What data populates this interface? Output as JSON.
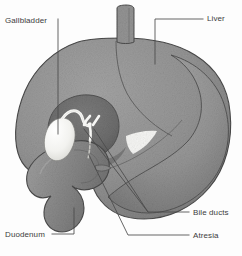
{
  "figure": {
    "background_color": "#fdfdfd"
  },
  "palette": {
    "organ_fill": "#949494",
    "organ_fill_dark": "#6d6d6d",
    "organ_fill_mid": "#878787",
    "organ_shadow": "#5f5f5f",
    "organ_highlight": "#b4b4b4",
    "duct_white": "#f7f7f5",
    "outline": "#4a4a4a",
    "leader_line": "#4a4a4a",
    "label_text": "#3c3c3c"
  },
  "labels": [
    {
      "id": "gallbladder",
      "text": "Gallbladder",
      "position": "top-left",
      "leader": "vertical line descending to gallbladder body"
    },
    {
      "id": "liver",
      "text": "Liver",
      "position": "top-right",
      "leader": "horizontal line then vertical drop into liver lobe"
    },
    {
      "id": "bile-ducts",
      "text": "Bile ducts",
      "position": "bottom-right",
      "leader": "two lines to hepatic duct branches"
    },
    {
      "id": "atresia",
      "text": "Atresia",
      "position": "bottom-right",
      "leader": "line to obliterated duct segment"
    },
    {
      "id": "duodenum",
      "text": "Duodenum",
      "position": "bottom-left",
      "leader": "horizontal line then vertical rise to duodenal loop"
    }
  ],
  "structures": [
    {
      "id": "liver",
      "name": "Liver",
      "shading": "stippled mid-gray"
    },
    {
      "id": "vessel",
      "name": "Vertical vessel / esophagus stub",
      "shading": "mid-gray tube"
    },
    {
      "id": "porta-hepatis",
      "name": "Porta hepatis recess",
      "shading": "dark gray"
    },
    {
      "id": "gallbladder",
      "name": "Gallbladder",
      "shading": "white / pale"
    },
    {
      "id": "cystic-duct",
      "name": "Cystic duct",
      "shading": "white tube"
    },
    {
      "id": "hepatic-duct-y",
      "name": "Hepatic duct bifurcation",
      "shading": "white Y-shape"
    },
    {
      "id": "duodenum",
      "name": "Duodenum",
      "shading": "mid-gray C-loop"
    },
    {
      "id": "stomach",
      "name": "Stomach / body shadow",
      "shading": "mid-gray with highlight"
    }
  ]
}
